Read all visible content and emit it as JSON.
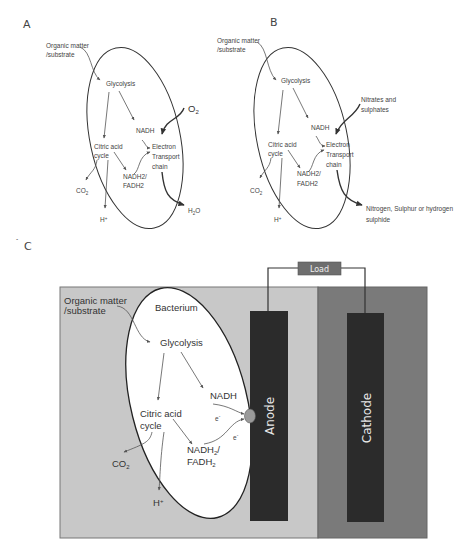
{
  "figure": {
    "panels": [
      {
        "id": "A",
        "label": "A",
        "input": [
          "Organic matter",
          "/substrate"
        ],
        "nodes": {
          "glycolysis": "Glycolysis",
          "nadh": "NADH",
          "citric_acid_cycle": [
            "Citric acid",
            "cycle"
          ],
          "nadh2_fadh2": [
            "NADH2/",
            "FADH2"
          ],
          "electron_transport_chain": [
            "Electron",
            "Transport",
            "chain"
          ],
          "co2": "CO2",
          "h_plus": "H+"
        },
        "electron_acceptor": "O2",
        "product": "H2O"
      },
      {
        "id": "B",
        "label": "B",
        "input": [
          "Organic matter",
          "/substrate"
        ],
        "nodes": {
          "glycolysis": "Glycolysis",
          "nadh": "NADH",
          "citric_acid_cycle": [
            "Citric acid",
            "cycle"
          ],
          "nadh2_fadh2": [
            "NADH2/",
            "FADH2"
          ],
          "electron_transport_chain": [
            "Electron",
            "Transport",
            "chain"
          ],
          "co2": "CO2",
          "h_plus": "H+"
        },
        "electron_acceptor": [
          "Nitrates and",
          "sulphates"
        ],
        "product": [
          "Nitrogen, Sulphur or hydrogen",
          "sulphide"
        ]
      },
      {
        "id": "C",
        "label": "C",
        "input": [
          "Organic matter",
          "/substrate"
        ],
        "cell_label": "Bacterium",
        "nodes": {
          "glycolysis": "Glycolysis",
          "nadh": "NADH",
          "citric_acid_cycle": [
            "Citric acid",
            "cycle"
          ],
          "nadh2_fadh2": [
            "NADH2/",
            "FADH2"
          ],
          "co2": "CO2",
          "h_plus": "H+",
          "electron_1": "e-",
          "electron_2": "e-"
        },
        "anode": "Anode",
        "cathode": "Cathode",
        "load": "Load",
        "colors": {
          "anode_chamber": "#c8c8c8",
          "cathode_chamber": "#7a7a7a",
          "electrode": "#2b2b2b",
          "load_box": "#6e6e6e",
          "mediator": "#9a9a9a"
        }
      }
    ]
  }
}
